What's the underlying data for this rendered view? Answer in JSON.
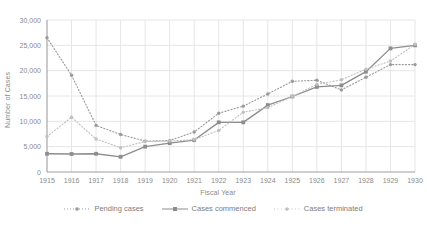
{
  "chart_data": {
    "type": "line",
    "title": "",
    "xlabel": "Fiscal Year",
    "ylabel": "Number of Cases",
    "categories": [
      1915,
      1916,
      1917,
      1918,
      1919,
      1920,
      1921,
      1922,
      1923,
      1924,
      1925,
      1926,
      1927,
      1928,
      1929,
      1930
    ],
    "xlim": [
      1915,
      1930
    ],
    "ylim": [
      0,
      30000
    ],
    "yticks": [
      0,
      5000,
      10000,
      15000,
      20000,
      25000,
      30000
    ],
    "ytick_labels": [
      "0",
      "5,000",
      "10,000",
      "15,000",
      "20,000",
      "25,000",
      "30,000"
    ],
    "xtick_labels": [
      "1915",
      "1916",
      "1917",
      "1918",
      "1919",
      "1920",
      "1921",
      "1922",
      "1923",
      "1924",
      "1925",
      "1926",
      "1927",
      "1928",
      "1929",
      "1930"
    ],
    "grid": true,
    "legend_position": "bottom",
    "series": [
      {
        "name": "Pending cases",
        "style": "dotted",
        "marker": "circle",
        "color": "#9a9a9a",
        "values": [
          26500,
          19100,
          9200,
          7400,
          6100,
          6200,
          7900,
          11600,
          13000,
          15400,
          17900,
          18100,
          16200,
          18700,
          21200,
          21200
        ]
      },
      {
        "name": "Cases commenced",
        "style": "solid",
        "marker": "square",
        "color": "#8d8d8d",
        "values": [
          3600,
          3550,
          3600,
          3000,
          5000,
          5700,
          6300,
          9800,
          9800,
          13200,
          14900,
          16800,
          17100,
          19800,
          24400,
          25000
        ]
      },
      {
        "name": "Cases terminated",
        "style": "dotted",
        "marker": "circle",
        "color": "#c0c0c0",
        "values": [
          7000,
          10800,
          6500,
          4800,
          6000,
          6100,
          6400,
          8200,
          11800,
          12700,
          14900,
          17300,
          18200,
          20300,
          21900,
          25200
        ]
      }
    ]
  },
  "axes": {
    "y_title": "Number of Cases",
    "x_title": "Fiscal Year"
  },
  "legend": {
    "items": [
      {
        "label": "Pending cases"
      },
      {
        "label": "Cases commenced"
      },
      {
        "label": "Cases terminated"
      }
    ]
  },
  "colors": {
    "grid": "#e6e6e6",
    "axis": "#9e9e9e",
    "text": "#8a8a8a",
    "pending": "#9a9a9a",
    "commenced": "#8d8d8d",
    "terminated": "#c0c0c0"
  }
}
